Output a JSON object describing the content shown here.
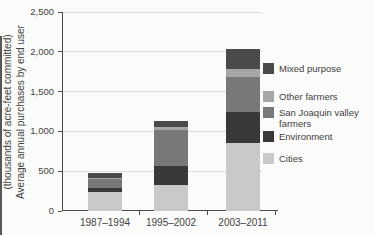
{
  "figure": {
    "background": "#fbfbfa",
    "text_color": "#3f3f3f",
    "axis_color": "#4a4a4a",
    "gridline_color": "#dbdbd8"
  },
  "chart_data": {
    "type": "bar",
    "stacked": true,
    "title": "",
    "categories": [
      "1987–1994",
      "1995–2002",
      "2003–2011"
    ],
    "series": [
      {
        "name": "Cities",
        "color": "#c9c9c9",
        "values": [
          240,
          330,
          850
        ]
      },
      {
        "name": "Environment",
        "color": "#383838",
        "values": [
          45,
          240,
          400
        ]
      },
      {
        "name": "San Joaquin valley farmers",
        "color": "#787878",
        "values": [
          115,
          445,
          430
        ]
      },
      {
        "name": "Other farmers",
        "color": "#a6a6a6",
        "values": [
          15,
          40,
          110
        ]
      },
      {
        "name": "Mixed purpose",
        "color": "#4a4a4a",
        "values": [
          60,
          70,
          240
        ]
      }
    ],
    "totals": [
      475,
      1125,
      2030
    ],
    "ylabel_line1": "Average annual purchases by end user",
    "ylabel_line2": "(thousands of acre-feet committed)",
    "ylim": [
      0,
      2500
    ],
    "ytick_step": 500,
    "yticks": [
      "0",
      "500",
      "1,000",
      "1,500",
      "2,000",
      "2,500"
    ],
    "grid": true,
    "legend_position": "right",
    "legend_order_top_to_bottom": [
      "Mixed purpose",
      "Other farmers",
      "San Joaquin valley farmers",
      "Environment",
      "Cities"
    ]
  }
}
